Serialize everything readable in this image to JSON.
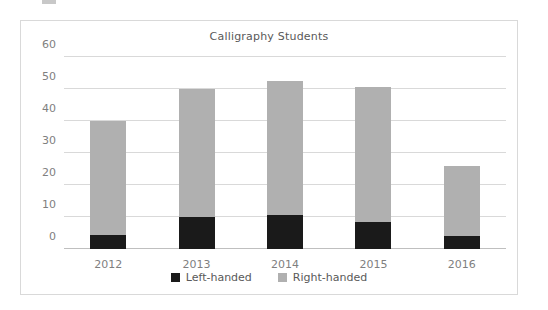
{
  "chart_data": {
    "type": "bar",
    "subtype": "stacked-bar",
    "title": "Calligraphy Students",
    "xlabel": "",
    "ylabel": "",
    "categories": [
      "2012",
      "2013",
      "2014",
      "2015",
      "2016"
    ],
    "series": [
      {
        "name": "Left-handed",
        "color": "#1a1a1a",
        "values": [
          4.5,
          10,
          10.5,
          8.5,
          4
        ]
      },
      {
        "name": "Right-handed",
        "color": "#b0b0b0",
        "values": [
          35.5,
          40,
          42,
          42,
          22
        ]
      }
    ],
    "totals": [
      40,
      50,
      52.5,
      50.5,
      26
    ],
    "ylim": [
      0,
      60
    ],
    "yticks": [
      0,
      10,
      20,
      30,
      40,
      50,
      60
    ],
    "ytick_labels": [
      "0",
      "10",
      "20",
      "30",
      "40",
      "50",
      "60"
    ],
    "grid": true,
    "legend_position": "bottom",
    "legend": [
      "Left-handed",
      "Right-handed"
    ]
  },
  "colors": {
    "left_handed": "#1a1a1a",
    "right_handed": "#b0b0b0",
    "gridline": "#d9d9d9",
    "axis": "#bfbfbf",
    "tick_text": "#7f7f7f",
    "title_text": "#595959",
    "frame_border": "#d9d9d9",
    "background": "#ffffff"
  }
}
